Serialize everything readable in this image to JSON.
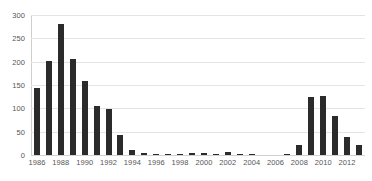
{
  "chart_data": {
    "type": "bar",
    "title": "",
    "subtitle": "",
    "xlabel": "",
    "ylabel": "",
    "ylim": [
      0,
      300
    ],
    "yticks": [
      0,
      50,
      100,
      150,
      200,
      250,
      300
    ],
    "grid": true,
    "legend": false,
    "legend_position": "none",
    "bar_color": "#2b2b2b",
    "gridline_color": "#e4e4e4",
    "axis_label_color": "#555555",
    "background_color": "#ffffff",
    "categories": [
      "1986",
      "1987",
      "1988",
      "1989",
      "1990",
      "1991",
      "1992",
      "1993",
      "1994",
      "1995",
      "1996",
      "1997",
      "1998",
      "1999",
      "2000",
      "2001",
      "2002",
      "2003",
      "2004",
      "2005",
      "2006",
      "2007",
      "2008",
      "2009",
      "2010",
      "2011",
      "2012",
      "2013"
    ],
    "values": [
      143,
      201,
      280,
      206,
      158,
      106,
      98,
      42,
      10,
      5,
      3,
      1,
      2,
      5,
      4,
      2,
      6,
      1,
      2,
      0,
      0,
      1,
      21,
      124,
      127,
      83,
      38,
      22
    ],
    "xtick_labels": [
      "1986",
      "1988",
      "1990",
      "1992",
      "1994",
      "1996",
      "1998",
      "2000",
      "2002",
      "2004",
      "2006",
      "2008",
      "2010",
      "2012"
    ],
    "xtick_categories": [
      "1986",
      "1988",
      "1990",
      "1992",
      "1994",
      "1996",
      "1998",
      "2000",
      "2002",
      "2004",
      "2006",
      "2008",
      "2010",
      "2012"
    ]
  }
}
